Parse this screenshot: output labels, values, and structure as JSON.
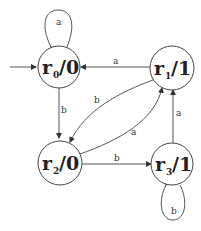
{
  "diagram": {
    "type": "state-machine",
    "states": [
      {
        "id": "r0",
        "name": "r",
        "sub": "0",
        "output": "/0",
        "initial": true
      },
      {
        "id": "r1",
        "name": "r",
        "sub": "1",
        "output": "/1"
      },
      {
        "id": "r2",
        "name": "r",
        "sub": "2",
        "output": "/0"
      },
      {
        "id": "r3",
        "name": "r",
        "sub": "3",
        "output": "/1"
      }
    ],
    "transitions": [
      {
        "from": "r0",
        "to": "r0",
        "label": "a"
      },
      {
        "from": "r0",
        "to": "r2",
        "label": "b"
      },
      {
        "from": "r1",
        "to": "r0",
        "label": "a"
      },
      {
        "from": "r1",
        "to": "r2",
        "label": "b"
      },
      {
        "from": "r2",
        "to": "r1",
        "label": "a"
      },
      {
        "from": "r2",
        "to": "r3",
        "label": "b"
      },
      {
        "from": "r3",
        "to": "r1",
        "label": "a"
      },
      {
        "from": "r3",
        "to": "r3",
        "label": "b"
      }
    ],
    "colors": {
      "stroke": "#444444",
      "text": "#222222",
      "background": "#ffffff"
    }
  }
}
